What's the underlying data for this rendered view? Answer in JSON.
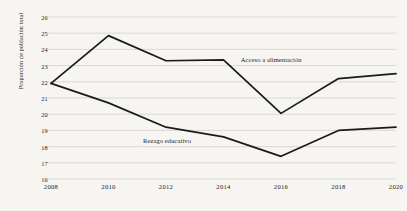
{
  "chart_data": {
    "type": "line",
    "title": "",
    "subtitle": "",
    "xlabel": "",
    "ylabel": "Proporción de población total",
    "categories": [
      "2008",
      "2010",
      "2012",
      "2014",
      "2016",
      "2018",
      "2020"
    ],
    "x": [
      2008,
      2010,
      2012,
      2014,
      2016,
      2018,
      2020
    ],
    "xlim": [
      2008,
      2020
    ],
    "ylim": [
      16,
      26
    ],
    "yticks": [
      "26",
      "25",
      "24",
      "23",
      "22",
      "21",
      "20",
      "19",
      "18",
      "17",
      "16"
    ],
    "ytick_values": [
      26,
      25,
      24,
      23,
      22,
      21,
      20,
      19,
      18,
      17,
      16
    ],
    "grid": "horizontal",
    "legend_position": "inline-annotation",
    "series": [
      {
        "name": "Acceso a alimentación",
        "values": [
          21.9,
          24.85,
          23.3,
          23.35,
          20.05,
          22.2,
          22.5
        ],
        "color": "#1a1a1a",
        "label_x": 2014.6,
        "label_y": 23.35
      },
      {
        "name": "Rezago educativo",
        "values": [
          21.9,
          20.7,
          19.2,
          18.6,
          17.4,
          19.0,
          19.2
        ],
        "color": "#1a1a1a",
        "label_x": 2011.2,
        "label_y": 18.35
      }
    ],
    "annotations": [
      {
        "text": "Acceso a alimentación",
        "series": "Acceso a alimentación"
      },
      {
        "text": "Rezago educativo",
        "series": "Rezago educativo"
      }
    ],
    "colors": {
      "background": "#f7f5f1",
      "gridline": "#c9c6c0",
      "line": "#1a1a1a",
      "text": "#24231f"
    }
  }
}
